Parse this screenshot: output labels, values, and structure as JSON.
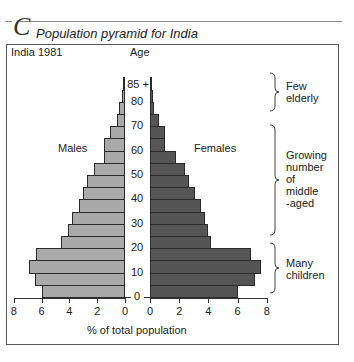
{
  "section_letter": "C",
  "title": "Population pyramid for India",
  "subtitle": "India 1981",
  "age_axis_label": "Age",
  "x_axis_label": "% of total population",
  "males_label": "Males",
  "females_label": "Females",
  "annotations": [
    {
      "text": "Few elderly",
      "lines": [
        "Few",
        "elderly"
      ]
    },
    {
      "text": "Growing number of middle-aged",
      "lines": [
        "Growing",
        "number",
        "of",
        "middle",
        "-aged"
      ]
    },
    {
      "text": "Many children",
      "lines": [
        "Many",
        "children"
      ]
    }
  ],
  "colors": {
    "males": "#a9a9a9",
    "females": "#555555",
    "outline": "#2a2a2a"
  },
  "chart_data": {
    "type": "bar",
    "orientation": "horizontal",
    "subtype": "population-pyramid",
    "title": "Population pyramid for India",
    "subtitle": "India 1981",
    "xlabel": "% of total population",
    "ylabel": "Age",
    "categories": [
      "0-4",
      "5-9",
      "10-14",
      "15-19",
      "20-24",
      "25-29",
      "30-34",
      "35-39",
      "40-44",
      "45-49",
      "50-54",
      "55-59",
      "60-64",
      "65-69",
      "70-74",
      "75-79",
      "80-84",
      "85+"
    ],
    "age_tick_labels": [
      "0",
      "10",
      "20",
      "30",
      "40",
      "50",
      "60",
      "70",
      "80",
      "85 +"
    ],
    "x_tick_labels_left": [
      "8",
      "6",
      "4",
      "2",
      "0"
    ],
    "x_tick_labels_right": [
      "0",
      "2",
      "4",
      "6",
      "8"
    ],
    "xlim": [
      0,
      8
    ],
    "series": [
      {
        "name": "Males",
        "side": "left",
        "values": [
          6.0,
          6.5,
          6.9,
          6.4,
          4.6,
          4.1,
          3.8,
          3.3,
          3.0,
          2.7,
          2.2,
          1.5,
          1.5,
          1.1,
          0.6,
          0.4,
          0.2,
          0.15
        ]
      },
      {
        "name": "Females",
        "side": "right",
        "values": [
          6.0,
          7.2,
          7.6,
          6.9,
          4.2,
          4.0,
          3.8,
          3.5,
          3.1,
          2.7,
          2.4,
          1.8,
          1.0,
          1.0,
          0.6,
          0.3,
          0.2,
          0.15
        ]
      }
    ],
    "legend": null,
    "grid": false
  }
}
